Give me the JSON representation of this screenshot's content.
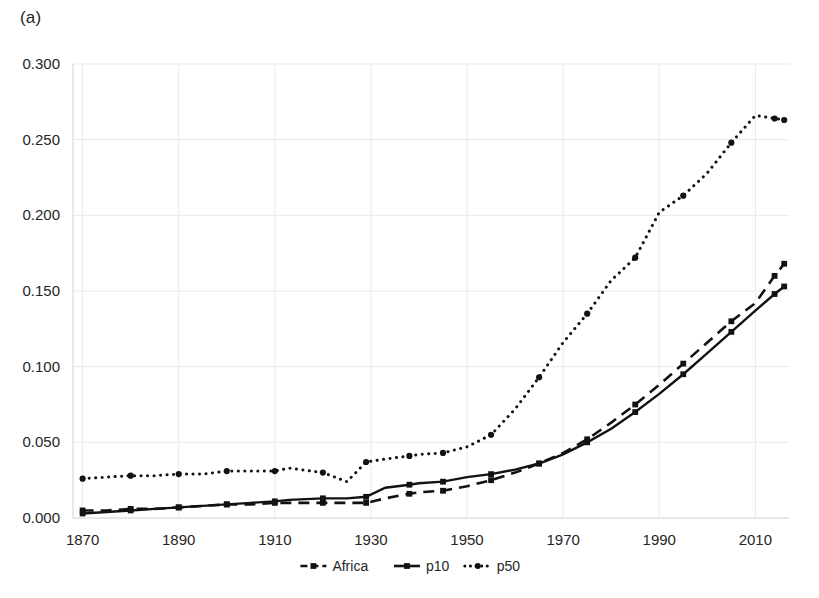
{
  "figure": {
    "panel_label": "(a)"
  },
  "chart_data": {
    "type": "line",
    "title": "",
    "xlabel": "",
    "ylabel": "",
    "xlim": [
      1868,
      2017
    ],
    "ylim": [
      0.0,
      0.3
    ],
    "grid": true,
    "legend_position": "bottom-center",
    "ytick_labels": [
      "0.000",
      "0.050",
      "0.100",
      "0.150",
      "0.200",
      "0.250",
      "0.300"
    ],
    "ytick_values": [
      0.0,
      0.05,
      0.1,
      0.15,
      0.2,
      0.25,
      0.3
    ],
    "xtick_labels": [
      "1870",
      "1890",
      "1910",
      "1930",
      "1950",
      "1970",
      "1990",
      "2010"
    ],
    "xtick_values": [
      1870,
      1890,
      1910,
      1930,
      1950,
      1970,
      1990,
      2010
    ],
    "x": [
      1870,
      1875,
      1880,
      1885,
      1890,
      1895,
      1900,
      1905,
      1910,
      1913,
      1920,
      1925,
      1929,
      1933,
      1938,
      1940,
      1945,
      1950,
      1955,
      1960,
      1965,
      1970,
      1975,
      1980,
      1985,
      1990,
      1995,
      2000,
      2005,
      2010,
      2014,
      2016
    ],
    "series": [
      {
        "name": "Africa",
        "style": "dashed",
        "marker": "square",
        "values": [
          0.005,
          0.005,
          0.006,
          0.006,
          0.007,
          0.008,
          0.009,
          0.009,
          0.01,
          0.01,
          0.01,
          0.01,
          0.01,
          0.013,
          0.016,
          0.017,
          0.018,
          0.021,
          0.025,
          0.03,
          0.036,
          0.043,
          0.052,
          0.063,
          0.075,
          0.088,
          0.102,
          0.116,
          0.13,
          0.142,
          0.16,
          0.168
        ]
      },
      {
        "name": "p10",
        "style": "solid",
        "marker": "square",
        "values": [
          0.003,
          0.004,
          0.005,
          0.006,
          0.007,
          0.008,
          0.009,
          0.01,
          0.011,
          0.012,
          0.013,
          0.013,
          0.014,
          0.02,
          0.022,
          0.023,
          0.024,
          0.027,
          0.029,
          0.032,
          0.036,
          0.042,
          0.05,
          0.059,
          0.07,
          0.082,
          0.095,
          0.109,
          0.123,
          0.137,
          0.148,
          0.153
        ]
      },
      {
        "name": "p50",
        "style": "dotted",
        "marker": "circle",
        "values": [
          0.026,
          0.027,
          0.028,
          0.028,
          0.029,
          0.029,
          0.031,
          0.031,
          0.031,
          0.033,
          0.03,
          0.024,
          0.037,
          0.039,
          0.041,
          0.042,
          0.043,
          0.047,
          0.055,
          0.072,
          0.093,
          0.116,
          0.135,
          0.157,
          0.172,
          0.202,
          0.213,
          0.228,
          0.248,
          0.266,
          0.264,
          0.263
        ]
      }
    ],
    "legend": [
      {
        "label": "Africa",
        "style": "dashed"
      },
      {
        "label": "p10",
        "style": "solid"
      },
      {
        "label": "p50",
        "style": "dotted"
      }
    ]
  }
}
